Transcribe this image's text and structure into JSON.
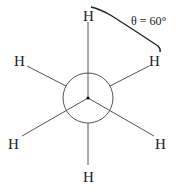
{
  "diagram": {
    "type": "Newman projection",
    "angle_label": "θ = 60°",
    "atoms": {
      "front_top": "H",
      "front_lower_left": "H",
      "front_lower_right": "H",
      "back_upper_left": "H",
      "back_upper_right": "H",
      "back_bottom": "H"
    },
    "colors": {
      "line": "#555555",
      "text": "#222222",
      "arc": "#222222"
    }
  }
}
